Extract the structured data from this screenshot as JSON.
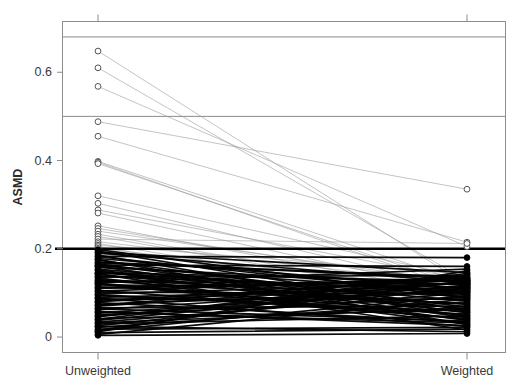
{
  "chart_data": {
    "type": "line",
    "subtype": "paired-slope-plot",
    "title": "",
    "xlabel": "",
    "ylabel": "ASMD",
    "categories": [
      "Unweighted",
      "Weighted"
    ],
    "x": [
      0,
      1
    ],
    "xlim": [
      -0.22,
      1.22
    ],
    "ylim": [
      -0.035,
      0.715
    ],
    "yticks": [
      0,
      0.2,
      0.4,
      0.6
    ],
    "ytick_labels": [
      "0",
      "0.2",
      "0.4",
      "0.6"
    ],
    "xtick_labels": [
      "Unweighted",
      "Weighted"
    ],
    "grid": false,
    "legend": null,
    "reference_lines": [
      {
        "y": 0.2,
        "color": "#000000",
        "width": 2.6,
        "name": "asmd-threshold-line"
      },
      {
        "y": 0.5,
        "color": "#8a8a8a",
        "width": 1.0,
        "name": "upper-reference-line-050"
      },
      {
        "y": 0.68,
        "color": "#8a8a8a",
        "width": 1.0,
        "name": "upper-reference-line-068"
      }
    ],
    "marker_rules": {
      "above_threshold": {
        "style": "open-circle",
        "fill": "#ffffff",
        "stroke": "#555555",
        "line_color": "#9c9c9c",
        "line_width": 0.7
      },
      "below_threshold": {
        "style": "filled-circle",
        "fill": "#000000",
        "stroke": "#000000",
        "line_color": "#000000",
        "line_width": 1.7
      }
    },
    "series": [
      {
        "name": "cov-01",
        "values": [
          0.648,
          0.118
        ]
      },
      {
        "name": "cov-02",
        "values": [
          0.61,
          0.128
        ]
      },
      {
        "name": "cov-03",
        "values": [
          0.568,
          0.205
        ]
      },
      {
        "name": "cov-04",
        "values": [
          0.398,
          0.122
        ]
      },
      {
        "name": "cov-05",
        "values": [
          0.396,
          0.104
        ]
      },
      {
        "name": "cov-06",
        "values": [
          0.393,
          0.112
        ]
      },
      {
        "name": "cov-07",
        "values": [
          0.455,
          0.215
        ]
      },
      {
        "name": "cov-08",
        "values": [
          0.488,
          0.335
        ]
      },
      {
        "name": "cov-09",
        "values": [
          0.32,
          0.134
        ]
      },
      {
        "name": "cov-10",
        "values": [
          0.303,
          0.108
        ]
      },
      {
        "name": "cov-11",
        "values": [
          0.288,
          0.13
        ]
      },
      {
        "name": "cov-12",
        "values": [
          0.281,
          0.1
        ]
      },
      {
        "name": "cov-13",
        "values": [
          0.252,
          0.095
        ]
      },
      {
        "name": "cov-14",
        "values": [
          0.246,
          0.115
        ]
      },
      {
        "name": "cov-15",
        "values": [
          0.24,
          0.122
        ]
      },
      {
        "name": "cov-16",
        "values": [
          0.233,
          0.09
        ]
      },
      {
        "name": "cov-17",
        "values": [
          0.228,
          0.084
        ]
      },
      {
        "name": "cov-18",
        "values": [
          0.222,
          0.212
        ]
      },
      {
        "name": "cov-19",
        "values": [
          0.216,
          0.118
        ]
      },
      {
        "name": "cov-20",
        "values": [
          0.212,
          0.078
        ]
      },
      {
        "name": "cov-21",
        "values": [
          0.208,
          0.142
        ]
      },
      {
        "name": "cov-22",
        "values": [
          0.205,
          0.072
        ]
      },
      {
        "name": "cov-23",
        "values": [
          0.201,
          0.105
        ]
      },
      {
        "name": "cov-24",
        "values": [
          0.198,
          0.088
        ]
      },
      {
        "name": "cov-25",
        "values": [
          0.195,
          0.06
        ]
      },
      {
        "name": "cov-26",
        "values": [
          0.19,
          0.124
        ]
      },
      {
        "name": "cov-27",
        "values": [
          0.186,
          0.046
        ]
      },
      {
        "name": "cov-28",
        "values": [
          0.182,
          0.096
        ]
      },
      {
        "name": "cov-29",
        "values": [
          0.178,
          0.11
        ]
      },
      {
        "name": "cov-30",
        "values": [
          0.174,
          0.068
        ]
      },
      {
        "name": "cov-31",
        "values": [
          0.17,
          0.132
        ]
      },
      {
        "name": "cov-32",
        "values": [
          0.166,
          0.055
        ]
      },
      {
        "name": "cov-33",
        "values": [
          0.162,
          0.1
        ]
      },
      {
        "name": "cov-34",
        "values": [
          0.158,
          0.118
        ]
      },
      {
        "name": "cov-35",
        "values": [
          0.154,
          0.082
        ]
      },
      {
        "name": "cov-36",
        "values": [
          0.15,
          0.038
        ]
      },
      {
        "name": "cov-37",
        "values": [
          0.146,
          0.126
        ]
      },
      {
        "name": "cov-38",
        "values": [
          0.142,
          0.064
        ]
      },
      {
        "name": "cov-39",
        "values": [
          0.138,
          0.106
        ]
      },
      {
        "name": "cov-40",
        "values": [
          0.134,
          0.03
        ]
      },
      {
        "name": "cov-41",
        "values": [
          0.13,
          0.092
        ]
      },
      {
        "name": "cov-42",
        "values": [
          0.126,
          0.12
        ]
      },
      {
        "name": "cov-43",
        "values": [
          0.122,
          0.05
        ]
      },
      {
        "name": "cov-44",
        "values": [
          0.118,
          0.114
        ]
      },
      {
        "name": "cov-45",
        "values": [
          0.114,
          0.076
        ]
      },
      {
        "name": "cov-46",
        "values": [
          0.11,
          0.128
        ]
      },
      {
        "name": "cov-47",
        "values": [
          0.106,
          0.042
        ]
      },
      {
        "name": "cov-48",
        "values": [
          0.102,
          0.098
        ]
      },
      {
        "name": "cov-49",
        "values": [
          0.098,
          0.122
        ]
      },
      {
        "name": "cov-50",
        "values": [
          0.094,
          0.058
        ]
      },
      {
        "name": "cov-51",
        "values": [
          0.09,
          0.112
        ]
      },
      {
        "name": "cov-52",
        "values": [
          0.086,
          0.086
        ]
      },
      {
        "name": "cov-53",
        "values": [
          0.082,
          0.13
        ]
      },
      {
        "name": "cov-54",
        "values": [
          0.078,
          0.034
        ]
      },
      {
        "name": "cov-55",
        "values": [
          0.074,
          0.104
        ]
      },
      {
        "name": "cov-56",
        "values": [
          0.07,
          0.124
        ]
      },
      {
        "name": "cov-57",
        "values": [
          0.066,
          0.07
        ]
      },
      {
        "name": "cov-58",
        "values": [
          0.062,
          0.116
        ]
      },
      {
        "name": "cov-59",
        "values": [
          0.058,
          0.026
        ]
      },
      {
        "name": "cov-60",
        "values": [
          0.054,
          0.108
        ]
      },
      {
        "name": "cov-61",
        "values": [
          0.05,
          0.09
        ]
      },
      {
        "name": "cov-62",
        "values": [
          0.046,
          0.126
        ]
      },
      {
        "name": "cov-63",
        "values": [
          0.042,
          0.062
        ]
      },
      {
        "name": "cov-64",
        "values": [
          0.038,
          0.118
        ]
      },
      {
        "name": "cov-65",
        "values": [
          0.034,
          0.1
        ]
      },
      {
        "name": "cov-66",
        "values": [
          0.03,
          0.048
        ]
      },
      {
        "name": "cov-67",
        "values": [
          0.026,
          0.112
        ]
      },
      {
        "name": "cov-68",
        "values": [
          0.022,
          0.08
        ]
      },
      {
        "name": "cov-69",
        "values": [
          0.018,
          0.022
        ]
      },
      {
        "name": "cov-70",
        "values": [
          0.014,
          0.094
        ]
      },
      {
        "name": "cov-71",
        "values": [
          0.01,
          0.018
        ]
      },
      {
        "name": "cov-72",
        "values": [
          0.006,
          0.086
        ]
      },
      {
        "name": "cov-73",
        "values": [
          0.16,
          0.044
        ]
      },
      {
        "name": "cov-74",
        "values": [
          0.145,
          0.102
        ]
      },
      {
        "name": "cov-75",
        "values": [
          0.128,
          0.074
        ]
      },
      {
        "name": "cov-76",
        "values": [
          0.112,
          0.132
        ]
      },
      {
        "name": "cov-77",
        "values": [
          0.096,
          0.052
        ]
      },
      {
        "name": "cov-78",
        "values": [
          0.08,
          0.122
        ]
      },
      {
        "name": "cov-79",
        "values": [
          0.064,
          0.036
        ]
      },
      {
        "name": "cov-80",
        "values": [
          0.048,
          0.11
        ]
      },
      {
        "name": "cov-81",
        "values": [
          0.032,
          0.066
        ]
      },
      {
        "name": "cov-82",
        "values": [
          0.016,
          0.128
        ]
      },
      {
        "name": "cov-83",
        "values": [
          0.192,
          0.146
        ]
      },
      {
        "name": "cov-84",
        "values": [
          0.176,
          0.028
        ]
      },
      {
        "name": "cov-85",
        "values": [
          0.168,
          0.136
        ]
      },
      {
        "name": "cov-86",
        "values": [
          0.152,
          0.056
        ]
      },
      {
        "name": "cov-87",
        "values": [
          0.136,
          0.14
        ]
      },
      {
        "name": "cov-88",
        "values": [
          0.12,
          0.04
        ]
      },
      {
        "name": "cov-89",
        "values": [
          0.104,
          0.134
        ]
      },
      {
        "name": "cov-90",
        "values": [
          0.088,
          0.024
        ]
      },
      {
        "name": "cov-91",
        "values": [
          0.072,
          0.138
        ]
      },
      {
        "name": "cov-92",
        "values": [
          0.056,
          0.032
        ]
      },
      {
        "name": "cov-93",
        "values": [
          0.04,
          0.144
        ]
      },
      {
        "name": "cov-94",
        "values": [
          0.024,
          0.012
        ]
      },
      {
        "name": "cov-95",
        "values": [
          0.012,
          0.15
        ]
      },
      {
        "name": "cov-96",
        "values": [
          0.004,
          0.008
        ]
      },
      {
        "name": "cov-97",
        "values": [
          0.183,
          0.18
        ]
      },
      {
        "name": "cov-98",
        "values": [
          0.163,
          0.16
        ]
      },
      {
        "name": "cov-99",
        "values": [
          0.143,
          0.016
        ]
      },
      {
        "name": "cov-100",
        "values": [
          0.123,
          0.154
        ]
      }
    ]
  },
  "axes": {
    "ylabel": "ASMD",
    "ytick_labels": [
      "0",
      "0.2",
      "0.4",
      "0.6"
    ],
    "xtick_labels": [
      "Unweighted",
      "Weighted"
    ]
  },
  "colors": {
    "above_threshold_line": "#9c9c9c",
    "below_threshold_line": "#000000",
    "threshold_line": "#000000",
    "reference_line": "#8a8a8a",
    "axis": "#8c8c8c",
    "text": "#3a3a3a",
    "background": "#ffffff"
  }
}
